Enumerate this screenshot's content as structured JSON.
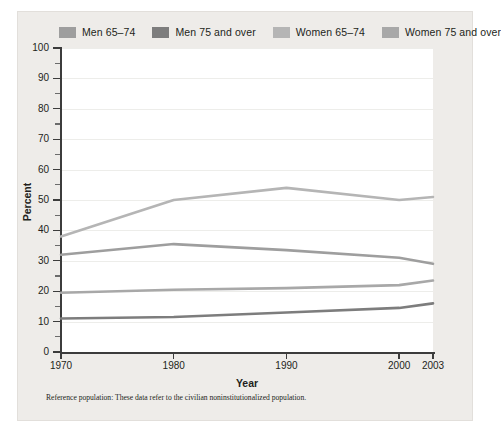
{
  "figure": {
    "footnote": "Reference population: These data refer to the civilian noninstitutionalized population.",
    "background_color": "#eeece9",
    "panel_color": "#ffffff"
  },
  "legend": {
    "position": "top",
    "items": [
      {
        "label": "Men 65–74",
        "color": "#9e9e9e",
        "swatch_name": "legend-swatch-men-65-74"
      },
      {
        "label": "Men 75 and over",
        "color": "#7d7d7d",
        "swatch_name": "legend-swatch-men-75-over"
      },
      {
        "label": "Women 65–74",
        "color": "#b5b5b5",
        "swatch_name": "legend-swatch-women-65-74"
      },
      {
        "label": "Women 75 and over",
        "color": "#a8a8a8",
        "swatch_name": "legend-swatch-women-75-over"
      }
    ]
  },
  "chart_data": {
    "type": "line",
    "title": "",
    "xlabel": "Year",
    "ylabel": "Percent",
    "x": [
      1970,
      1980,
      1990,
      2000,
      2003
    ],
    "x_tick_labels": [
      "1970",
      "1980",
      "1990",
      "2000",
      "2003"
    ],
    "y_tick_labels": [
      "0",
      "10",
      "20",
      "30",
      "40",
      "50",
      "60",
      "70",
      "80",
      "90",
      "100"
    ],
    "y_ticks": [
      0,
      10,
      20,
      30,
      40,
      50,
      60,
      70,
      80,
      90,
      100
    ],
    "y_minor_ticks": [
      5,
      15,
      25,
      35,
      45,
      55,
      65,
      75,
      85,
      95
    ],
    "xlim": [
      1970,
      2003
    ],
    "ylim": [
      0,
      100
    ],
    "grid": true,
    "legend_position": "top",
    "series": [
      {
        "name": "Men 65–74",
        "color": "#9e9e9e",
        "values": [
          32.0,
          35.5,
          33.5,
          31.0,
          29.0
        ]
      },
      {
        "name": "Men 75 and over",
        "color": "#7d7d7d",
        "values": [
          11.0,
          11.5,
          13.0,
          14.5,
          16.0
        ]
      },
      {
        "name": "Women 65–74",
        "color": "#b5b5b5",
        "values": [
          38.0,
          50.0,
          54.0,
          50.0,
          51.0
        ]
      },
      {
        "name": "Women 75 and over",
        "color": "#a8a8a8",
        "values": [
          19.5,
          20.5,
          21.0,
          22.0,
          23.5
        ]
      }
    ]
  }
}
